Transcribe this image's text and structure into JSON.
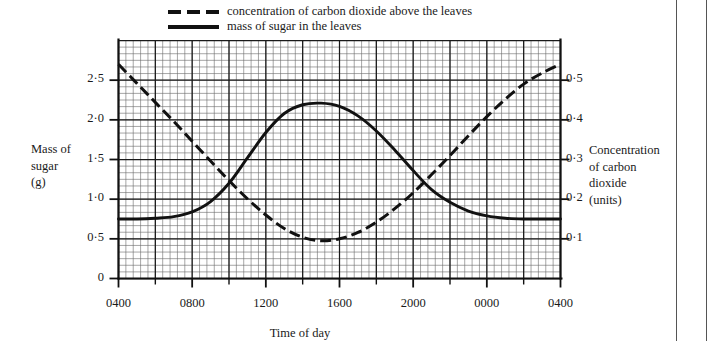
{
  "figure": {
    "legend": [
      {
        "style": "dashed",
        "label": "concentration of carbon dioxide above the leaves"
      },
      {
        "style": "solid",
        "label": "mass of sugar in the leaves"
      }
    ],
    "axis_titles": {
      "left": "Mass of\nsugar\n(g)",
      "left_lines": [
        "Mass of",
        "sugar",
        "(g)"
      ],
      "right": "Concentration of carbon dioxide (units)",
      "right_lines": [
        "Concentration",
        "of carbon",
        "dioxide",
        "(units)"
      ],
      "bottom": "Time of day"
    }
  },
  "chart_data": {
    "type": "line",
    "title": "",
    "xlabel": "Time of day",
    "ylabel": "Mass of sugar (g)",
    "y2label": "Concentration of carbon dioxide (units)",
    "grid": true,
    "legend_position": "top",
    "x_tick_labels": [
      "0400",
      "0800",
      "1200",
      "1600",
      "2000",
      "0000",
      "0400"
    ],
    "x_tick_hours": [
      4,
      8,
      12,
      16,
      20,
      24,
      28
    ],
    "xlim": [
      4,
      28
    ],
    "y_tick_labels_left": [
      "0",
      "0·5",
      "1·0",
      "1·5",
      "2·0",
      "2·5"
    ],
    "y_tick_values_left": [
      0,
      0.5,
      1.0,
      1.5,
      2.0,
      2.5
    ],
    "ylim_left": [
      0,
      3.0
    ],
    "y_tick_labels_right": [
      "0·1",
      "0·2",
      "0·3",
      "0·4",
      "0·5"
    ],
    "y_tick_values_right": [
      0.1,
      0.2,
      0.3,
      0.4,
      0.5
    ],
    "ylim_right": [
      0,
      0.6
    ],
    "series": [
      {
        "name": "mass of sugar in the leaves",
        "axis": "left",
        "style": "solid",
        "color": "#111111",
        "x": [
          4,
          5,
          6,
          7,
          8,
          9,
          10,
          11,
          12,
          13,
          14,
          15,
          16,
          17,
          18,
          19,
          20,
          21,
          22,
          23,
          24,
          25,
          26,
          27,
          28
        ],
        "y": [
          0.75,
          0.75,
          0.76,
          0.78,
          0.84,
          0.97,
          1.2,
          1.52,
          1.84,
          2.08,
          2.19,
          2.21,
          2.17,
          2.05,
          1.86,
          1.62,
          1.36,
          1.12,
          0.96,
          0.85,
          0.79,
          0.76,
          0.75,
          0.75,
          0.75
        ]
      },
      {
        "name": "concentration of carbon dioxide above the leaves",
        "axis": "right",
        "style": "dashed",
        "color": "#111111",
        "x": [
          4,
          5,
          6,
          7,
          8,
          9,
          10,
          11,
          12,
          13,
          14,
          15,
          16,
          17,
          18,
          19,
          20,
          21,
          22,
          23,
          24,
          25,
          26,
          27,
          28
        ],
        "y": [
          0.54,
          0.492,
          0.444,
          0.396,
          0.346,
          0.296,
          0.247,
          0.201,
          0.16,
          0.126,
          0.104,
          0.095,
          0.1,
          0.116,
          0.142,
          0.176,
          0.216,
          0.262,
          0.31,
          0.36,
          0.408,
          0.452,
          0.49,
          0.518,
          0.54
        ]
      }
    ]
  }
}
